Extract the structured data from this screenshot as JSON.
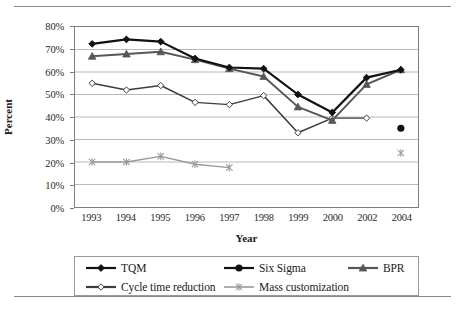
{
  "chart_data": {
    "type": "line",
    "title": "",
    "xlabel": "Year",
    "ylabel": "Percent",
    "categories": [
      "1993",
      "1994",
      "1995",
      "1996",
      "1997",
      "1998",
      "1999",
      "2000",
      "2002",
      "2004"
    ],
    "ylim": [
      0,
      80
    ],
    "ytick_values": [
      0,
      10,
      20,
      30,
      40,
      50,
      60,
      70,
      80
    ],
    "ytick_labels": [
      "0%",
      "10%",
      "20%",
      "30%",
      "40%",
      "50%",
      "60%",
      "70%",
      "80%"
    ],
    "grid": "horizontal",
    "legend_position": "bottom",
    "series": [
      {
        "name": "TQM",
        "marker": "filled-diamond",
        "color": "#111111",
        "values": [
          72.5,
          74.5,
          73.5,
          66,
          62,
          61.5,
          50,
          42,
          57.5,
          61
        ]
      },
      {
        "name": "Six Sigma",
        "marker": "filled-circle",
        "color": "#111111",
        "values": [
          null,
          null,
          null,
          null,
          null,
          null,
          null,
          null,
          null,
          35
        ]
      },
      {
        "name": "BPR",
        "marker": "filled-triangle",
        "color": "#575757",
        "values": [
          67,
          68,
          69,
          65.5,
          61.5,
          58,
          44.5,
          38.5,
          54.5,
          61
        ]
      },
      {
        "name": "Cycle time reduction",
        "marker": "open-diamond",
        "color": "#3d3d3d",
        "values": [
          55,
          52,
          54,
          46.5,
          45.5,
          49.5,
          33,
          39.5,
          39.5,
          null
        ]
      },
      {
        "name": "Mass customization",
        "marker": "star-x",
        "color": "#9a9a9a",
        "values": [
          20,
          20,
          22.5,
          19,
          17.5,
          null,
          null,
          null,
          null,
          24
        ]
      }
    ]
  },
  "axes": {
    "y_title": "Percent",
    "x_title": "Year"
  },
  "legend": {
    "items": [
      {
        "label": "TQM",
        "marker": "filled-diamond",
        "color": "#111111"
      },
      {
        "label": "Six Sigma",
        "marker": "filled-circle",
        "color": "#111111"
      },
      {
        "label": "BPR",
        "marker": "filled-triangle",
        "color": "#575757"
      },
      {
        "label": "Cycle time reduction",
        "marker": "open-diamond",
        "color": "#3d3d3d"
      },
      {
        "label": "Mass customization",
        "marker": "star-x",
        "color": "#9a9a9a"
      }
    ]
  },
  "colors": {
    "grid": "#b8b8b8",
    "frame": "#7d7d7d",
    "rule": "#8a8a8a",
    "text": "#1a1a1a"
  }
}
